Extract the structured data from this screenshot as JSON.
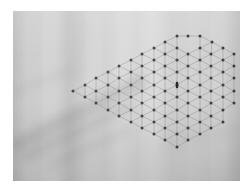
{
  "image": {
    "kind": "photograph",
    "subject": "light gray woven fabric with a hexagonal snowflake dot lattice marking",
    "alt_text": "Close-up photo of pale grey textile; a hexagonal arrangement of small dark dots joined by faint straight lines sits to the right of centre, with a short dark vertical mark at the pattern's core.",
    "frame": {
      "left": 13,
      "top": 11,
      "width": 227,
      "height": 170
    },
    "margin_color": "#ffffff"
  },
  "colors": {
    "fabric_light": "#d6d6d6",
    "fabric_mid": "#cbcbcb",
    "fabric_dark": "#b4b4b4",
    "shadow": "#8a8a8a",
    "dot": "#3a3a3a",
    "line": "#8d8d8d",
    "center_mark": "#1b1b1b"
  },
  "pattern": {
    "name": "hexagonal-dot-lattice",
    "description": "Triangular/hexagonal lattice of dark dots connected by faint straight segments forming a six-lobed snowflake outline",
    "center": {
      "x": 177,
      "y": 87
    },
    "radius": 52,
    "dot_count": 91,
    "dot_radius": 1.5,
    "spacing": 11.5,
    "symmetry": "6-fold",
    "center_mark": {
      "x": 177,
      "y": 85,
      "width": 2.4,
      "height": 6.5
    }
  },
  "chart_data": {
    "type": "scatter",
    "title": "",
    "xlabel": "",
    "ylabel": "",
    "grid": false,
    "legend": null,
    "note": "Dot positions of the hexagonal lattice in photo-plate pixel coordinates (origin at photo top-left).",
    "xlim": [
      0,
      227
    ],
    "ylim": [
      0,
      170
    ],
    "points": [
      [
        164,
        25
      ],
      [
        175,
        25
      ],
      [
        187,
        25
      ],
      [
        152,
        31
      ],
      [
        199,
        31
      ],
      [
        141,
        37
      ],
      [
        164,
        37
      ],
      [
        187,
        37
      ],
      [
        210,
        37
      ],
      [
        129,
        43
      ],
      [
        152,
        43
      ],
      [
        175,
        43
      ],
      [
        198,
        43
      ],
      [
        221,
        43
      ],
      [
        118,
        49
      ],
      [
        141,
        49
      ],
      [
        164,
        49
      ],
      [
        187,
        49
      ],
      [
        210,
        49
      ],
      [
        106,
        55
      ],
      [
        129,
        55
      ],
      [
        152,
        55
      ],
      [
        175,
        55
      ],
      [
        198,
        55
      ],
      [
        221,
        55
      ],
      [
        95,
        61
      ],
      [
        118,
        61
      ],
      [
        141,
        61
      ],
      [
        164,
        61
      ],
      [
        187,
        61
      ],
      [
        210,
        61
      ],
      [
        83,
        67
      ],
      [
        106,
        67
      ],
      [
        129,
        67
      ],
      [
        152,
        67
      ],
      [
        175,
        67
      ],
      [
        198,
        67
      ],
      [
        221,
        67
      ],
      [
        72,
        74
      ],
      [
        95,
        74
      ],
      [
        118,
        74
      ],
      [
        141,
        74
      ],
      [
        164,
        74
      ],
      [
        187,
        74
      ],
      [
        210,
        74
      ],
      [
        60,
        80
      ],
      [
        83,
        80
      ],
      [
        106,
        80
      ],
      [
        129,
        80
      ],
      [
        152,
        80
      ],
      [
        175,
        80
      ],
      [
        198,
        80
      ],
      [
        221,
        80
      ],
      [
        72,
        86
      ],
      [
        95,
        86
      ],
      [
        118,
        86
      ],
      [
        141,
        86
      ],
      [
        164,
        86
      ],
      [
        187,
        86
      ],
      [
        210,
        86
      ],
      [
        83,
        92
      ],
      [
        106,
        92
      ],
      [
        129,
        92
      ],
      [
        152,
        92
      ],
      [
        175,
        92
      ],
      [
        198,
        92
      ],
      [
        221,
        92
      ],
      [
        95,
        99
      ],
      [
        118,
        99
      ],
      [
        141,
        99
      ],
      [
        164,
        99
      ],
      [
        187,
        99
      ],
      [
        210,
        99
      ],
      [
        106,
        105
      ],
      [
        129,
        105
      ],
      [
        152,
        105
      ],
      [
        175,
        105
      ],
      [
        198,
        105
      ],
      [
        118,
        111
      ],
      [
        141,
        111
      ],
      [
        164,
        111
      ],
      [
        187,
        111
      ],
      [
        210,
        111
      ],
      [
        129,
        117
      ],
      [
        152,
        117
      ],
      [
        175,
        117
      ],
      [
        198,
        117
      ],
      [
        141,
        123
      ],
      [
        164,
        123
      ],
      [
        187,
        123
      ],
      [
        152,
        129
      ],
      [
        175,
        129
      ],
      [
        164,
        136
      ]
    ]
  }
}
